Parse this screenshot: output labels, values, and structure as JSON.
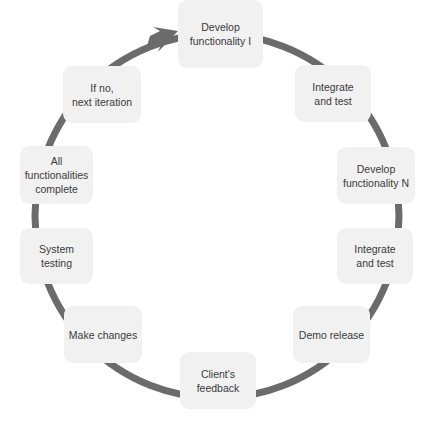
{
  "diagram": {
    "type": "cycle",
    "ring_color": "#6b6b6b",
    "node_background": "#f1f1f1",
    "text_color": "#3a3a3a",
    "nodes": [
      {
        "id": "develop-functionality-1",
        "label": "Develop\nfunctionality I",
        "x": 178,
        "y": 0,
        "w": 85,
        "h": 68
      },
      {
        "id": "integrate-and-test-1",
        "label": "Integrate\nand test",
        "x": 295,
        "y": 65,
        "w": 76,
        "h": 57
      },
      {
        "id": "develop-functionality-n",
        "label": "Develop\nfunctionality N",
        "x": 337,
        "y": 147,
        "w": 78,
        "h": 57
      },
      {
        "id": "integrate-and-test-2",
        "label": "Integrate\nand test",
        "x": 337,
        "y": 228,
        "w": 76,
        "h": 56
      },
      {
        "id": "demo-release",
        "label": "Demo release",
        "x": 293,
        "y": 306,
        "w": 77,
        "h": 57
      },
      {
        "id": "clients-feedback",
        "label": "Client's\nfeedback",
        "x": 180,
        "y": 352,
        "w": 76,
        "h": 57
      },
      {
        "id": "make-changes",
        "label": "Make changes",
        "x": 64,
        "y": 306,
        "w": 78,
        "h": 57
      },
      {
        "id": "system-testing",
        "label": "System testing",
        "x": 20,
        "y": 228,
        "w": 73,
        "h": 56
      },
      {
        "id": "all-functionalities-complete",
        "label": "All\nfunctionalities\ncomplete",
        "x": 20,
        "y": 146,
        "w": 73,
        "h": 58
      },
      {
        "id": "if-no-next-iteration",
        "label": "If no,\nnext iteration",
        "x": 63,
        "y": 66,
        "w": 78,
        "h": 57
      }
    ],
    "flow": "clockwise",
    "arrow": {
      "from": "if-no-next-iteration",
      "to": "develop-functionality-1"
    }
  }
}
